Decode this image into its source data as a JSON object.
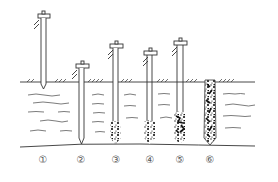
{
  "diagram": {
    "colors": {
      "line": "#333333",
      "background": "#ffffff",
      "concrete": "#111111"
    },
    "ground": {
      "y": 82,
      "x1": 20,
      "x2": 255
    },
    "stages": [
      {
        "label": "①",
        "x": 43,
        "cap_y": 14,
        "tip_y": 88,
        "concrete_top": null,
        "description": "casing positioned"
      },
      {
        "label": "②",
        "x": 80,
        "cap_y": 64,
        "tip_y": 143,
        "concrete_top": null,
        "description": "casing driven"
      },
      {
        "label": "③",
        "x": 115,
        "cap_y": 44,
        "tip_y": 143,
        "concrete_top": 122,
        "description": "concrete poured"
      },
      {
        "label": "④",
        "x": 149,
        "cap_y": 51,
        "tip_y": 143,
        "concrete_top": 120,
        "description": "casing withdrawn partially"
      },
      {
        "label": "⑤",
        "x": 180,
        "cap_y": 41,
        "tip_y": 143,
        "concrete_top": 113,
        "description": "casing re-driven"
      },
      {
        "label": "⑥",
        "x": 210,
        "cap_y": null,
        "tip_y": 143,
        "concrete_top": 80,
        "description": "pile completed"
      }
    ]
  }
}
